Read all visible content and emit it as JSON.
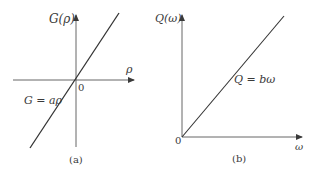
{
  "panels": [
    {
      "id": "a",
      "caption": "(a)",
      "y_axis_label": "G(ρ)",
      "x_axis_label": "ρ",
      "origin_label": "0",
      "line_label": "G = aρ",
      "description": "Straight line through the origin extending into negative and positive quadrants"
    },
    {
      "id": "b",
      "caption": "(b)",
      "y_axis_label": "Q(ω)",
      "x_axis_label": "ω",
      "origin_label": "0",
      "line_label": "Q = bω",
      "description": "Straight line starting at origin in the first quadrant"
    }
  ],
  "colors": {
    "stroke": "#3a3a3a",
    "background": "#ffffff"
  }
}
